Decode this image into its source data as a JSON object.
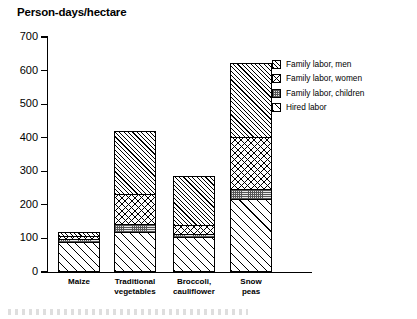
{
  "chart_data": {
    "type": "bar",
    "subtype": "stacked",
    "title": "Person-days/hectare",
    "xlabel": "",
    "ylabel": "Person-days/hectare",
    "ylim": [
      0,
      700
    ],
    "ytick_step": 100,
    "yticks": [
      0,
      100,
      200,
      300,
      400,
      500,
      600,
      700
    ],
    "ytick_labels": [
      "0",
      "100",
      "200",
      "300",
      "400",
      "500",
      "600",
      "700"
    ],
    "grid": false,
    "legend_position": "right",
    "categories": [
      "Maize",
      "Traditional vegetables",
      "Broccoli, cauliflower",
      "Snow peas"
    ],
    "category_lines": [
      [
        "Maize"
      ],
      [
        "Traditional",
        "vegetables"
      ],
      [
        "Broccoli,",
        "cauliflower"
      ],
      [
        "Snow",
        "peas"
      ]
    ],
    "series": [
      {
        "name": "Hired labor",
        "pattern": "wide-diagonal-hatch",
        "values": [
          88,
          115,
          100,
          215
        ]
      },
      {
        "name": "Family labor, children",
        "pattern": "fine-grid",
        "values": [
          10,
          25,
          10,
          30
        ]
      },
      {
        "name": "Family labor, women",
        "pattern": "cross-hatch",
        "values": [
          10,
          90,
          27,
          155
        ]
      },
      {
        "name": "Family labor, men",
        "pattern": "diagonal-hatch",
        "values": [
          12,
          190,
          148,
          222
        ]
      }
    ],
    "totals": [
      120,
      420,
      285,
      622
    ]
  },
  "legend": {
    "items": [
      {
        "label": "Family labor, men",
        "pattern": "diagonal-hatch"
      },
      {
        "label": "Family labor, women",
        "pattern": "cross-hatch"
      },
      {
        "label": "Family labor, children",
        "pattern": "fine-grid"
      },
      {
        "label": "Hired labor",
        "pattern": "wide-diagonal-hatch"
      }
    ]
  },
  "colors": {
    "ink": "#000000",
    "background": "#ffffff",
    "children_fill": "#e8e8e8"
  }
}
